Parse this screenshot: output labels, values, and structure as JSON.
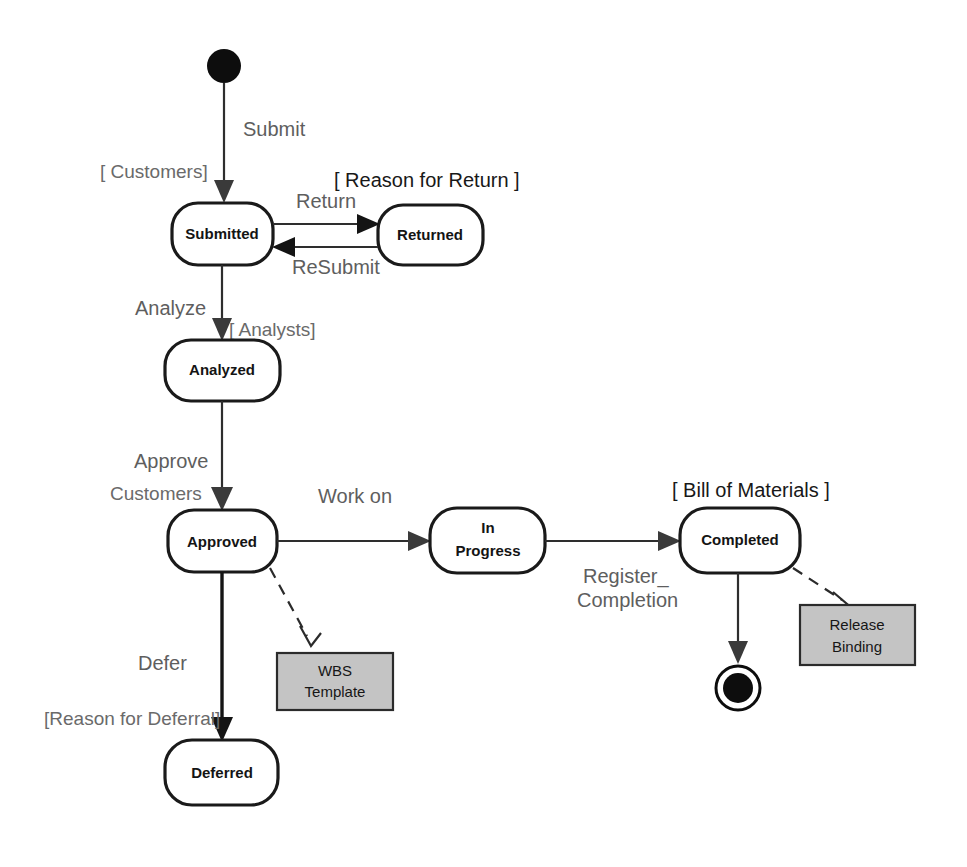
{
  "diagram": {
    "type": "uml-state-machine-diagram",
    "background_color": "#ffffff",
    "state_fill": "#ffffff",
    "state_stroke": "#1a1a1a",
    "note_fill": "#c4c4c4",
    "note_stroke": "#2b2b2b",
    "label_color": "#5e5e5e",
    "initial_node": {
      "name": "initial-state",
      "cx": 224,
      "cy": 66,
      "r": 17
    },
    "final_node": {
      "name": "final-state",
      "cx": 738,
      "cy": 688,
      "r_outer": 22,
      "r_inner": 15
    },
    "states": [
      {
        "id": "submitted",
        "label": "Submitted",
        "x": 172,
        "y": 203,
        "w": 101,
        "h": 62
      },
      {
        "id": "returned",
        "label": "Returned",
        "x": 378,
        "y": 205,
        "w": 105,
        "h": 60
      },
      {
        "id": "analyzed",
        "label": "Analyzed",
        "x": 165,
        "y": 340,
        "w": 115,
        "h": 61
      },
      {
        "id": "approved",
        "label": "Approved",
        "x": 168,
        "y": 510,
        "w": 109,
        "h": 62
      },
      {
        "id": "in_progress",
        "label_line1": "In",
        "label_line2": "Progress",
        "x": 430,
        "y": 508,
        "w": 115,
        "h": 65
      },
      {
        "id": "completed",
        "label": "Completed",
        "x": 680,
        "y": 508,
        "w": 120,
        "h": 65
      },
      {
        "id": "deferred",
        "label": "Deferred",
        "x": 165,
        "y": 740,
        "w": 113,
        "h": 65
      }
    ],
    "notes": [
      {
        "id": "wbs_template",
        "line1": "WBS",
        "line2": "Template",
        "x": 277,
        "y": 653,
        "w": 116,
        "h": 57
      },
      {
        "id": "release_binding",
        "line1": "Release",
        "line2": "Binding",
        "x": 800,
        "y": 605,
        "w": 115,
        "h": 60
      }
    ],
    "transitions": [
      {
        "id": "t_submit",
        "event": "Submit",
        "guard": "[ Customers]",
        "from": "initial",
        "to": "submitted"
      },
      {
        "id": "t_return",
        "event": "Return",
        "guard": "[  Reason for Return  ]",
        "from": "submitted",
        "to": "returned"
      },
      {
        "id": "t_resubmit",
        "event": "ReSubmit",
        "guard": "",
        "from": "returned",
        "to": "submitted"
      },
      {
        "id": "t_analyze",
        "event": "Analyze",
        "guard": "[ Analysts]",
        "from": "submitted",
        "to": "analyzed"
      },
      {
        "id": "t_approve",
        "event": "Approve",
        "guard": "Customers",
        "from": "analyzed",
        "to": "approved"
      },
      {
        "id": "t_workon",
        "event": "Work on",
        "guard": "",
        "from": "approved",
        "to": "in_progress"
      },
      {
        "id": "t_register",
        "event_line1": "Register_",
        "event_line2": "Completion",
        "guard": "[  Bill of Materials  ]",
        "from": "in_progress",
        "to": "completed"
      },
      {
        "id": "t_finish",
        "event": "",
        "guard": "",
        "from": "completed",
        "to": "final"
      },
      {
        "id": "t_defer",
        "event": "Defer",
        "guard": "[Reason for Deferral]",
        "from": "approved",
        "to": "deferred"
      }
    ],
    "dependencies": [
      {
        "id": "d_wbs",
        "from": "approved",
        "to": "wbs_template"
      },
      {
        "id": "d_release",
        "from": "completed",
        "to": "release_binding"
      }
    ],
    "labels": {
      "submit": "Submit",
      "customers_guard": "[ Customers]",
      "return": "Return",
      "reason_for_return": "[  Reason for Return  ]",
      "resubmit": "ReSubmit",
      "analyze": "Analyze",
      "analysts_guard": "[ Analysts]",
      "approve": "Approve",
      "customers": "Customers",
      "work_on": "Work on",
      "register": "Register_",
      "completion": "Completion",
      "bill_of_materials": "[  Bill of Materials  ]",
      "defer": "Defer",
      "reason_for_deferral": "[Reason for Deferral]"
    },
    "state_labels": {
      "submitted": "Submitted",
      "returned": "Returned",
      "analyzed": "Analyzed",
      "approved": "Approved",
      "in_progress_line1": "In",
      "in_progress_line2": "Progress",
      "completed": "Completed",
      "deferred": "Deferred"
    },
    "note_labels": {
      "wbs_line1": "WBS",
      "wbs_line2": "Template",
      "release_line1": "Release",
      "release_line2": "Binding"
    }
  }
}
